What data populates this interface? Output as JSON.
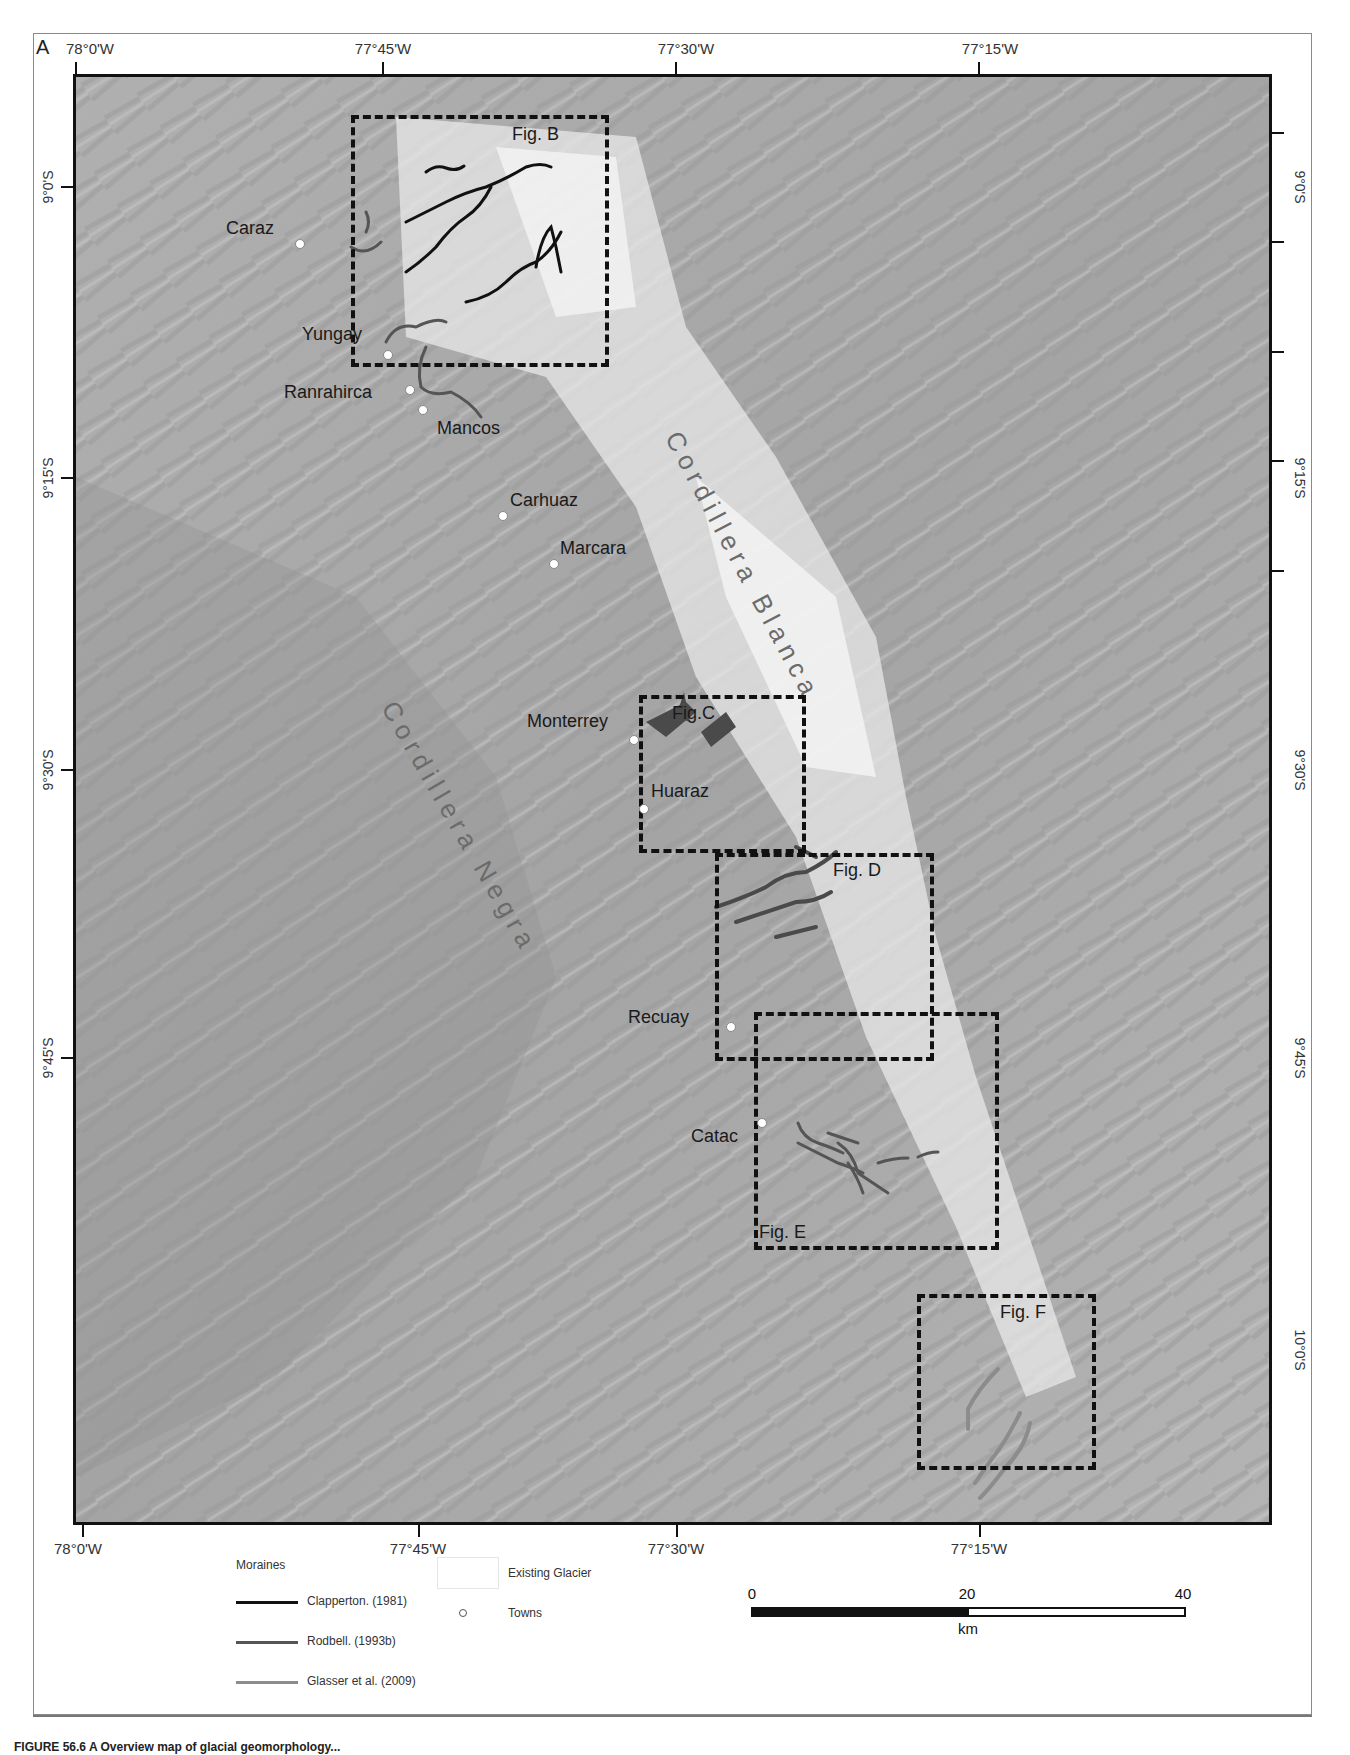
{
  "figure": {
    "panel_letter": "A",
    "caption": "FIGURE 56.6 A Overview map of glacial geomorphology..."
  },
  "map": {
    "longitude_ticks": [
      {
        "label": "78°0'W",
        "x": 76
      },
      {
        "label": "77°45'W",
        "x": 383
      },
      {
        "label": "77°30'W",
        "x": 676
      },
      {
        "label": "77°15'W",
        "x": 979
      }
    ],
    "latitude_ticks": [
      {
        "label": "9°0'S",
        "y": 187
      },
      {
        "label": "9°15'S",
        "y": 478
      },
      {
        "label": "9°30'S",
        "y": 770
      },
      {
        "label": "9°45'S",
        "y": 1058
      },
      {
        "label": "10°0'S",
        "y": 1350
      }
    ],
    "ranges": {
      "blanca": "Cordillera Blanca",
      "negra": "Cordillera Negra"
    },
    "towns": [
      {
        "name": "Caraz",
        "x": 300,
        "y": 244
      },
      {
        "name": "Yungay",
        "x": 388,
        "y": 355
      },
      {
        "name": "Ranrahirca",
        "x": 410,
        "y": 390
      },
      {
        "name": "Mancos",
        "x": 423,
        "y": 410
      },
      {
        "name": "Carhuaz",
        "x": 503,
        "y": 516
      },
      {
        "name": "Marcara",
        "x": 554,
        "y": 564
      },
      {
        "name": "Monterrey",
        "x": 634,
        "y": 740
      },
      {
        "name": "Huaraz",
        "x": 644,
        "y": 809
      },
      {
        "name": "Recuay",
        "x": 731,
        "y": 1027
      },
      {
        "name": "Catac",
        "x": 762,
        "y": 1123
      }
    ],
    "inset_boxes": [
      {
        "label": "Fig. B",
        "x": 351,
        "y": 115,
        "w": 258,
        "h": 252
      },
      {
        "label": "Fig.C",
        "x": 639,
        "y": 695,
        "w": 167,
        "h": 158
      },
      {
        "label": "Fig. D",
        "x": 715,
        "y": 853,
        "w": 219,
        "h": 208
      },
      {
        "label": "Fig. E",
        "x": 754,
        "y": 1012,
        "w": 245,
        "h": 238
      },
      {
        "label": "Fig. F",
        "x": 917,
        "y": 1294,
        "w": 179,
        "h": 176
      }
    ]
  },
  "legend": {
    "moraines_title": "Moraines",
    "items": [
      {
        "label": "Clapperton. (1981)",
        "color": "#111111"
      },
      {
        "label": "Rodbell. (1993b)",
        "color": "#555555"
      },
      {
        "label": "Glasser et al. (2009)",
        "color": "#8c8c8c"
      }
    ],
    "existing_glacier": "Existing Glacier",
    "towns": "Towns"
  },
  "scale_bar": {
    "ticks": [
      "0",
      "20",
      "40"
    ],
    "unit": "km"
  }
}
